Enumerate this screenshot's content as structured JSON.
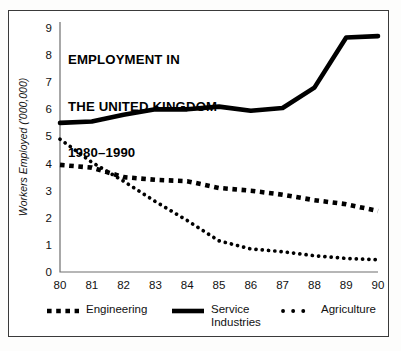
{
  "figure": {
    "title_lines": [
      "EMPLOYMENT IN",
      "THE UNITED KINGDOM",
      "1980–1990"
    ],
    "frame_color": "#3a3a3a",
    "ink_color": "#000000",
    "background": "#ffffff"
  },
  "chart_data": {
    "type": "line",
    "title": "EMPLOYMENT IN THE UNITED KINGDOM 1980–1990",
    "xlabel": "",
    "ylabel": "Workers Employed ('000,000)",
    "x": [
      80,
      81,
      82,
      83,
      84,
      85,
      86,
      87,
      88,
      89,
      90
    ],
    "x_tick_labels": [
      "80",
      "81",
      "82",
      "83",
      "84",
      "85",
      "86",
      "87",
      "88",
      "89",
      "90"
    ],
    "y_tick_labels": [
      "0",
      "1",
      "2",
      "3",
      "4",
      "5",
      "6",
      "7",
      "8",
      "9"
    ],
    "xlim": [
      80,
      90
    ],
    "ylim": [
      0,
      9
    ],
    "grid": false,
    "legend_position": "below-axis",
    "series": [
      {
        "name": "Engineering",
        "style": "square-dashed",
        "values": [
          3.95,
          3.85,
          3.5,
          3.4,
          3.35,
          3.1,
          3.0,
          2.85,
          2.65,
          2.5,
          2.25
        ]
      },
      {
        "name": "Service Industries",
        "style": "solid",
        "values": [
          5.5,
          5.55,
          5.8,
          6.0,
          6.0,
          6.1,
          5.95,
          6.05,
          6.8,
          8.65,
          8.7
        ]
      },
      {
        "name": "Agriculture",
        "style": "dotted",
        "values": [
          4.9,
          4.05,
          3.35,
          2.6,
          1.9,
          1.15,
          0.85,
          0.75,
          0.6,
          0.5,
          0.45
        ]
      }
    ]
  },
  "legend": {
    "items": [
      {
        "label": "Engineering",
        "style": "square-dashed"
      },
      {
        "label": "Service\nIndustries",
        "style": "solid"
      },
      {
        "label": "Agriculture",
        "style": "dotted"
      }
    ]
  }
}
